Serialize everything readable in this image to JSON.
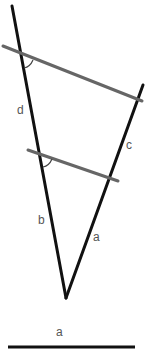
{
  "diagram": {
    "type": "geometry",
    "colors": {
      "main_lines": "#111111",
      "transversals": "#666666",
      "labels": "#555555",
      "background": "#ffffff"
    },
    "labels": {
      "left_upper": "d",
      "right_upper": "c",
      "left_lower": "b",
      "right_lower": "a",
      "reference_segment": "a"
    },
    "angle_markers": [
      {
        "at": "upper-transversal-left-intersection"
      },
      {
        "at": "lower-transversal-left-intersection"
      }
    ]
  }
}
